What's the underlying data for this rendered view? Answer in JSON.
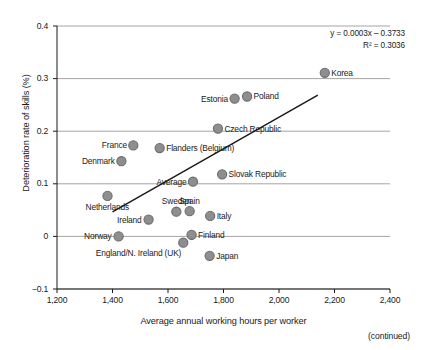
{
  "figure": {
    "continued_note": "(continued)"
  },
  "chart_data": {
    "type": "scatter",
    "title": "",
    "xlabel": "Average annual working hours per worker",
    "ylabel": "Deterioration rate of skills (%)",
    "xlim": [
      1200,
      2400
    ],
    "ylim": [
      -0.1,
      0.4
    ],
    "grid": "horizontal",
    "legend": "none",
    "xticks": [
      1200,
      1400,
      1600,
      1800,
      2000,
      2200,
      2400
    ],
    "xticklabels": [
      "1,200",
      "1,400",
      "1,600",
      "1,800",
      "2,000",
      "2,200",
      "2,400"
    ],
    "yticks": [
      -0.1,
      0,
      0.1,
      0.2,
      0.3,
      0.4
    ],
    "yticklabels": [
      "−0.1",
      "0",
      "0.1",
      "0.2",
      "0.3",
      "0.4"
    ],
    "annotations": {
      "equation": "y = 0.0003x – 0.3733",
      "r_squared": "R² = 0.3036"
    },
    "trendline": {
      "slope": 0.0003,
      "intercept": -0.3733,
      "x_start": 1400,
      "x_end": 2140,
      "y_start": 0.0467,
      "y_end": 0.2687
    },
    "points": [
      {
        "name": "Korea",
        "x": 2165,
        "y": 0.311,
        "label_pos": "right"
      },
      {
        "name": "Poland",
        "x": 1885,
        "y": 0.266,
        "label_pos": "right"
      },
      {
        "name": "Estonia",
        "x": 1840,
        "y": 0.262,
        "label_pos": "left"
      },
      {
        "name": "Czech Republic",
        "x": 1780,
        "y": 0.205,
        "label_pos": "right"
      },
      {
        "name": "France",
        "x": 1475,
        "y": 0.173,
        "label_pos": "left"
      },
      {
        "name": "Flanders (Belgium)",
        "x": 1570,
        "y": 0.168,
        "label_pos": "right"
      },
      {
        "name": "Denmark",
        "x": 1432,
        "y": 0.143,
        "label_pos": "left"
      },
      {
        "name": "Slovak Republic",
        "x": 1795,
        "y": 0.118,
        "label_pos": "right"
      },
      {
        "name": "Average",
        "x": 1690,
        "y": 0.104,
        "label_pos": "left"
      },
      {
        "name": "Netherlands",
        "x": 1382,
        "y": 0.077,
        "label_pos": "below"
      },
      {
        "name": "Spain",
        "x": 1678,
        "y": 0.048,
        "label_pos": "above"
      },
      {
        "name": "Sweden",
        "x": 1630,
        "y": 0.047,
        "label_pos": "above"
      },
      {
        "name": "Italy",
        "x": 1752,
        "y": 0.039,
        "label_pos": "right"
      },
      {
        "name": "Ireland",
        "x": 1530,
        "y": 0.032,
        "label_pos": "left"
      },
      {
        "name": "Finland",
        "x": 1685,
        "y": 0.003,
        "label_pos": "right"
      },
      {
        "name": "Norway",
        "x": 1422,
        "y": 0.0,
        "label_pos": "left"
      },
      {
        "name": "England/N. Ireland (UK)",
        "x": 1655,
        "y": -0.012,
        "label_pos": "below-left"
      },
      {
        "name": "Japan",
        "x": 1750,
        "y": -0.037,
        "label_pos": "right"
      }
    ],
    "style": {
      "marker_fill": "#8e8e8e",
      "marker_stroke": "#6d6d6d",
      "gridline_color": "#9a9a9a",
      "axis_color": "#1a1a1a",
      "trendline_color": "#1a1a1a",
      "text_color": "#1a1a1a"
    }
  }
}
